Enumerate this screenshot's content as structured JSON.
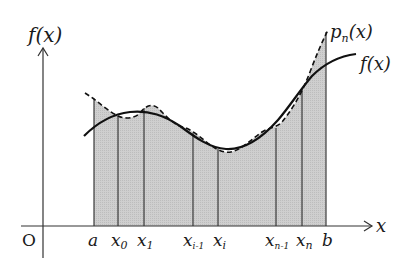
{
  "figure": {
    "y_axis_label": "f(x)",
    "x_axis_label": "x",
    "origin_label": "O",
    "curve_labels": {
      "polynomial": "p",
      "polynomial_sub": "n",
      "polynomial_arg": "(x)",
      "function": "f(x)"
    },
    "tick_labels": [
      {
        "main": "a",
        "sub": ""
      },
      {
        "main": "x",
        "sub": "0"
      },
      {
        "main": "x",
        "sub": "1"
      },
      {
        "main": "x",
        "sub": "i-1"
      },
      {
        "main": "x",
        "sub": "i"
      },
      {
        "main": "x",
        "sub": "n-1"
      },
      {
        "main": "x",
        "sub": "n"
      },
      {
        "main": "b",
        "sub": ""
      }
    ],
    "colors": {
      "axis": "#333333",
      "curve": "#111111",
      "shade": "#c9c9c9"
    }
  }
}
